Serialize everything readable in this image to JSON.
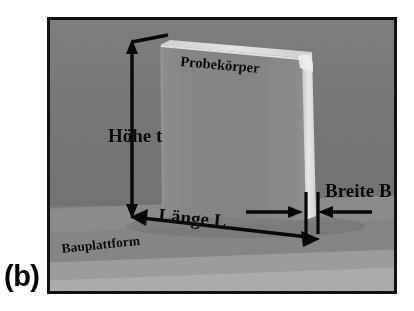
{
  "figure": {
    "caption": "(b)"
  },
  "photo": {
    "description": "Grayscale photograph of a thin upright plate specimen standing on an additive manufacturing build platform",
    "frame_color": "#111111",
    "background_color": "#7c7c7c",
    "platform_color": "#ababab"
  },
  "labels": {
    "specimen": "Probekörper",
    "platform": "Bauplattform"
  },
  "dimensions": [
    {
      "id": "height",
      "label": "Höhe t",
      "symbol": "t",
      "orientation": "vertical",
      "arrow": "double-headed"
    },
    {
      "id": "length",
      "label": "Länge L",
      "symbol": "L",
      "orientation": "diagonal",
      "arrow": "double-headed"
    },
    {
      "id": "width",
      "label": "Breite B",
      "symbol": "B",
      "orientation": "horizontal",
      "arrow": "inward-pair-with-ticks"
    }
  ]
}
